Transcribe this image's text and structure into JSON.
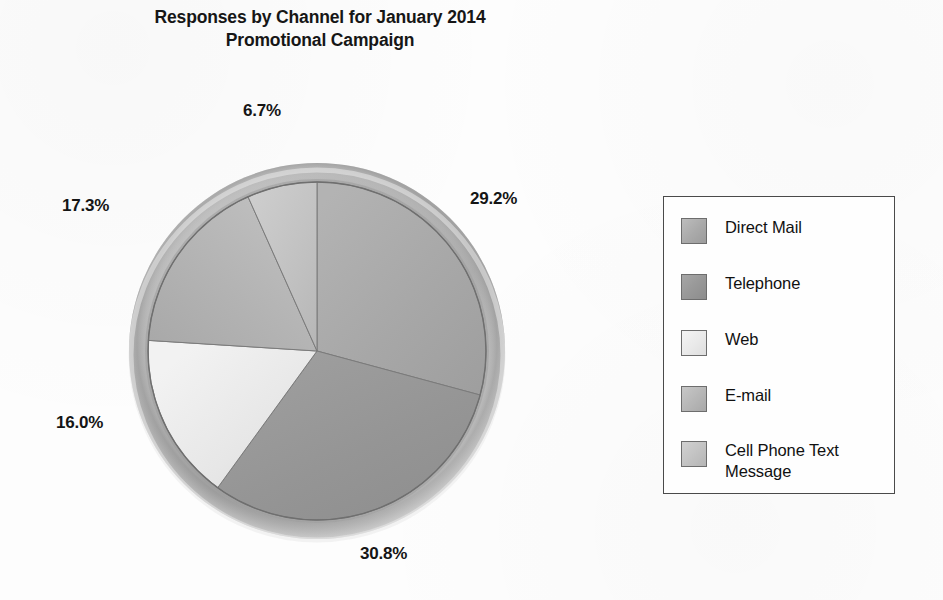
{
  "chart_data": {
    "type": "pie",
    "title": "Responses by Channel for January 2014 Promotional Campaign",
    "title_line1": "Responses by Channel for January 2014",
    "title_line2": "Promotional Campaign",
    "xlabel": "",
    "ylabel": "",
    "grid": false,
    "legend_position": "right",
    "units": "percent",
    "start_angle_deg": 0,
    "direction": "clockwise",
    "categories": [
      "Direct Mail",
      "Telephone",
      "Web",
      "E-mail",
      "Cell Phone Text Message"
    ],
    "values": [
      29.2,
      30.8,
      16.0,
      17.3,
      6.7
    ],
    "labels": [
      "29.2%",
      "30.8%",
      "16.0%",
      "17.3%",
      "6.7%"
    ],
    "total": 100.0,
    "colors": [
      "#a9a9a9",
      "#979797",
      "#e9e9e9",
      "#b6b6b6",
      "#c2c2c2"
    ],
    "slices": [
      {
        "name": "Direct Mail",
        "value": 29.2,
        "label": "29.2%",
        "color": "#a9a9a9",
        "start_deg": 0.0,
        "end_deg": 105.1
      },
      {
        "name": "Telephone",
        "value": 30.8,
        "label": "30.8%",
        "color": "#979797",
        "start_deg": 105.1,
        "end_deg": 216.0
      },
      {
        "name": "Web",
        "value": 16.0,
        "label": "16.0%",
        "color": "#e9e9e9",
        "start_deg": 216.0,
        "end_deg": 273.6
      },
      {
        "name": "E-mail",
        "value": 17.3,
        "label": "17.3%",
        "color": "#b6b6b6",
        "start_deg": 273.6,
        "end_deg": 335.9
      },
      {
        "name": "Cell Phone Text Message",
        "value": 6.7,
        "label": "6.7%",
        "color": "#c2c2c2",
        "start_deg": 335.9,
        "end_deg": 360.0
      }
    ]
  },
  "title": {
    "line1": "Responses by Channel for January 2014",
    "line2": "Promotional Campaign"
  },
  "pie": {
    "labels": {
      "cell_phone_text": "6.7%",
      "direct_mail": "29.2%",
      "email": "17.3%",
      "web": "16.0%",
      "telephone": "30.8%"
    }
  },
  "legend": {
    "items": [
      {
        "label": "Direct Mail",
        "swatch_color": "#a9a9a9"
      },
      {
        "label": "Telephone",
        "swatch_color": "#979797"
      },
      {
        "label": "Web",
        "swatch_color": "#e9e9e9"
      },
      {
        "label": "E-mail",
        "swatch_color": "#b6b6b6"
      },
      {
        "label": "Cell Phone Text Message",
        "swatch_color": "#c2c2c2"
      }
    ]
  },
  "style": {
    "background": "#fdfdfd",
    "text_color": "#111111",
    "border_color": "#4a4a4a",
    "rim_color": "#b3b3b3"
  }
}
